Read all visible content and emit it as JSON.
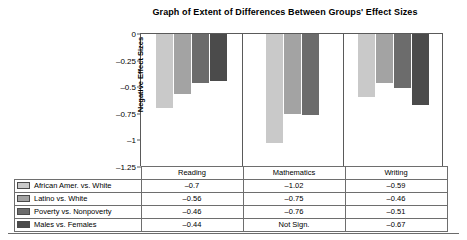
{
  "chart_data": {
    "type": "bar",
    "title": "Graph of Extent of Differences Between Groups' Effect Sizes",
    "xlabel": "",
    "ylabel": "Negative Effect Sizes",
    "ylim": [
      -1.25,
      0
    ],
    "grid": false,
    "legend_position": "bottom-table",
    "categories": [
      "Reading",
      "Mathematics",
      "Writing"
    ],
    "series": [
      {
        "name": "African Amer. vs. White",
        "color": "#c9c9c9",
        "values": [
          -0.7,
          -1.02,
          -0.59
        ],
        "display_values": [
          "–0.7",
          "–1.02",
          "–0.59"
        ]
      },
      {
        "name": "Latino vs. White",
        "color": "#a3a3a3",
        "values": [
          -0.56,
          -0.75,
          -0.46
        ],
        "display_values": [
          "–0.56",
          "–0.75",
          "–0.46"
        ]
      },
      {
        "name": "Poverty vs. Nonpoverty",
        "color": "#6c6c6c",
        "values": [
          -0.46,
          -0.76,
          -0.51
        ],
        "display_values": [
          "–0.46",
          "–0.76",
          "–0.51"
        ]
      },
      {
        "name": "Males vs. Females",
        "color": "#4b4b4b",
        "values": [
          -0.44,
          null,
          -0.67
        ],
        "display_values": [
          "–0.44",
          "Not Sign.",
          "–0.67"
        ]
      }
    ],
    "yticks": [
      0,
      -0.25,
      -0.5,
      -0.75,
      -1,
      -1.25
    ],
    "ytick_labels": [
      "0",
      "–0.25",
      "–0.5",
      "–0.75",
      "–1",
      "–1.25"
    ]
  },
  "table": {
    "corner_label": "",
    "headers": [
      "Reading",
      "Mathematics",
      "Writing"
    ],
    "rows": [
      {
        "label": "African Amer. vs. White",
        "color": "#c9c9c9",
        "cells": [
          "–0.7",
          "–1.02",
          "–0.59"
        ]
      },
      {
        "label": "Latino vs. White",
        "color": "#a3a3a3",
        "cells": [
          "–0.56",
          "–0.75",
          "–0.46"
        ]
      },
      {
        "label": "Poverty vs. Nonpoverty",
        "color": "#6c6c6c",
        "cells": [
          "–0.46",
          "–0.76",
          "–0.51"
        ]
      },
      {
        "label": "Males vs. Females",
        "color": "#4b4b4b",
        "cells": [
          "–0.44",
          "Not Sign.",
          "–0.67"
        ]
      }
    ]
  }
}
